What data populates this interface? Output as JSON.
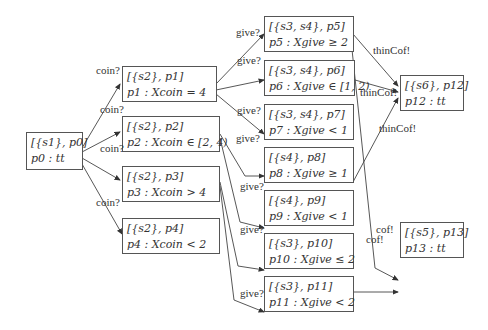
{
  "nodes": {
    "n0": {
      "line1": "[{s1}, p0]",
      "line2": "p0 : tt"
    },
    "n1": {
      "line1": "[{s2}, p1]",
      "line2": "p1 : Xcoin = 4"
    },
    "n2": {
      "line1": "[{s2}, p2]",
      "line2": "p2 : Xcoin ∈ [2, 4)"
    },
    "n3": {
      "line1": "[{s2}, p3]",
      "line2": "p3 : Xcoin > 4"
    },
    "n4": {
      "line1": "[{s2}, p4]",
      "line2": "p4 : Xcoin < 2"
    },
    "n5": {
      "line1": "[{s3, s4}, p5]",
      "line2": "p5 : Xgive ≥ 2"
    },
    "n6": {
      "line1": "[{s3, s4}, p6]",
      "line2": "p6 : Xgive ∈ [1, 2)"
    },
    "n7": {
      "line1": "[{s3, s4}, p7]",
      "line2": "p7 : Xgive < 1"
    },
    "n8": {
      "line1": "[{s4}, p8]",
      "line2": "p8 : Xgive ≥ 1"
    },
    "n9": {
      "line1": "[{s4}, p9]",
      "line2": "p9 : Xgive < 1"
    },
    "n10": {
      "line1": "[{s3}, p10]",
      "line2": "p10 : Xgive ≤ 2"
    },
    "n11": {
      "line1": "[{s3}, p11]",
      "line2": "p11 : Xgive < 2"
    },
    "n12": {
      "line1": "[{s6}, p12]",
      "line2": "p12 : tt"
    },
    "n13": {
      "line1": "[{s5}, p13]",
      "line2": "p13 : tt"
    }
  },
  "edge_labels": {
    "coin1": "coin?",
    "coin2": "coin?",
    "coin3": "coin?",
    "coin4": "coin?",
    "give5": "give?",
    "give6": "give?",
    "give7": "give?",
    "give8": "give?",
    "give9": "give?",
    "give10": "give?",
    "give11": "give?",
    "thin5": "thinCof!",
    "thin6": "thinCof!",
    "thin8": "thinCof!",
    "cof5": "cof!",
    "cof10": "cof!"
  }
}
